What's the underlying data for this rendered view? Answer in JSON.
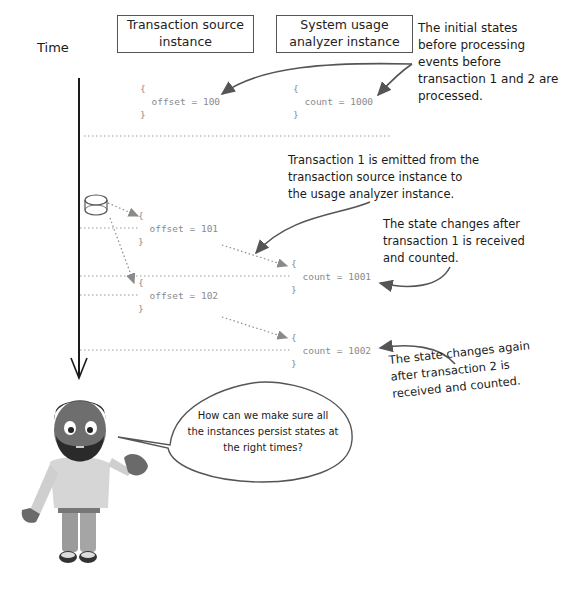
{
  "diagram": {
    "time_label": "Time",
    "columns": [
      {
        "label_line1": "Transaction source",
        "label_line2": "instance"
      },
      {
        "label_line1": "System usage",
        "label_line2": "analyzer instance"
      }
    ],
    "states": {
      "initial_source": {
        "open": "{",
        "body": "offset = 100",
        "close": "}"
      },
      "initial_analyzer": {
        "open": "{",
        "body": "count = 1000",
        "close": "}"
      },
      "source_after_t1": {
        "open": "{",
        "body": "offset = 101",
        "close": "}"
      },
      "analyzer_after_t1": {
        "open": "{",
        "body": "count = 1001",
        "close": "}"
      },
      "source_after_t2": {
        "open": "{",
        "body": "offset = 102",
        "close": "}"
      },
      "analyzer_after_t2": {
        "open": "{",
        "body": "count = 1002",
        "close": "}"
      }
    },
    "annotations": {
      "initial": [
        "The initial states",
        "before processing",
        "events before",
        "transaction 1 and 2 are",
        "processed."
      ],
      "emitted": [
        "Transaction 1 is emitted from the",
        "transaction source instance to",
        "the usage analyzer instance."
      ],
      "changed_t1": [
        "The state changes after",
        "transaction 1 is received",
        "and counted."
      ],
      "changed_t2": [
        "The state changes again",
        "after transaction 2 is",
        "received and counted."
      ]
    },
    "speech_bubble": [
      "How can we make sure all",
      "the instances persist states at",
      "the right times?"
    ],
    "icons": {
      "event_source": "database-cylinder-icon",
      "character": "bearded-man-character"
    },
    "colors": {
      "line": "#1a1a1a",
      "dotted": "#9a9a9a",
      "code": "#8a8a8a",
      "arrow": "#555555"
    }
  }
}
